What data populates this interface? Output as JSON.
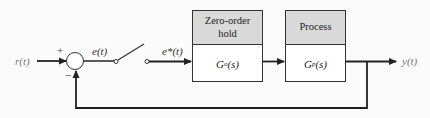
{
  "diagram": {
    "type": "sampled-data feedback control block diagram",
    "input": {
      "label": "r(t)"
    },
    "summing_junction": {
      "plus_sign": "+",
      "minus_sign": "−"
    },
    "error_signal": {
      "label": "e(t)"
    },
    "sampler": {
      "type": "switch"
    },
    "sampled_signal": {
      "label": "e*(t)"
    },
    "blocks": [
      {
        "title": "Zero-order hold",
        "title_line1": "Zero-order",
        "title_line2": "hold",
        "transfer_function": "Go(s)",
        "tf_main": "G",
        "tf_sub": "o",
        "tf_arg": "(s)"
      },
      {
        "title": "Process",
        "title_line1": "Process",
        "title_line2": "",
        "transfer_function": "Gp(s)",
        "tf_main": "G",
        "tf_sub": "p",
        "tf_arg": "(s)"
      }
    ],
    "output": {
      "label": "y(t)"
    },
    "feedback": {
      "type": "unity negative feedback"
    },
    "colors": {
      "line": "#222222",
      "block_header": "#d9d9d9",
      "block_body": "#ffffff",
      "background": "#fbfbfb"
    }
  }
}
